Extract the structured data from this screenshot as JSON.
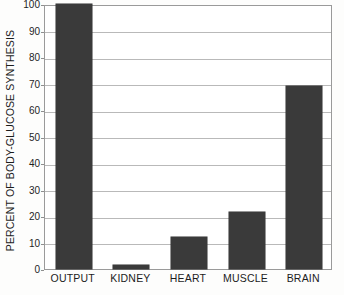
{
  "chart_data": {
    "type": "bar",
    "title": "",
    "xlabel": "",
    "ylabel": "PERCENT OF BODY-GLUCOSE SYNTHESIS",
    "categories": [
      "OUTPUT",
      "KIDNEY",
      "HEART",
      "MUSCLE",
      "BRAIN"
    ],
    "values": [
      100,
      1.5,
      12,
      21.5,
      69
    ],
    "ylim": [
      0,
      100
    ],
    "yticks": [
      0,
      10,
      20,
      30,
      40,
      50,
      60,
      70,
      80,
      90,
      100
    ],
    "ytick_labels": [
      "0",
      "10",
      "20",
      "30",
      "40",
      "50",
      "60",
      "70",
      "80",
      "90",
      "100"
    ],
    "grid": true,
    "legend": false,
    "bar_color": "#3a3a3a",
    "grid_color": "#b9b9b9",
    "frame_color": "#9a9a9a"
  }
}
